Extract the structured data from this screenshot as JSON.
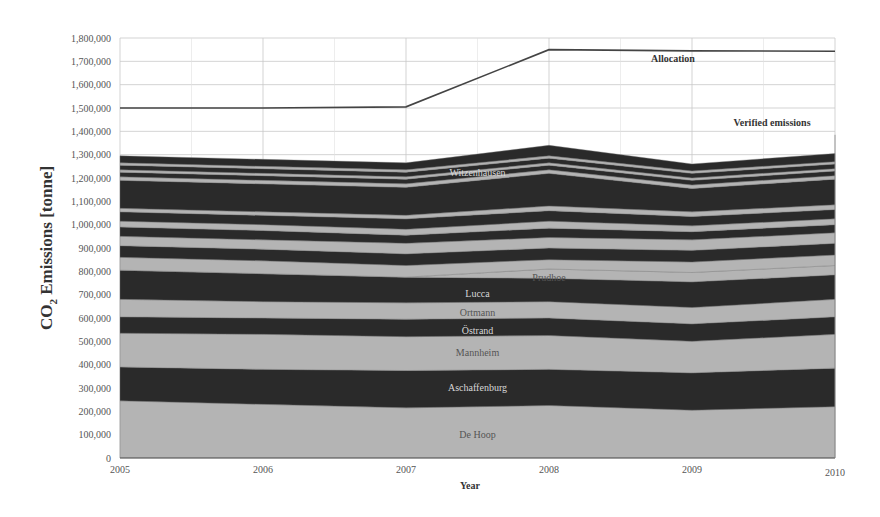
{
  "chart_data": {
    "type": "area",
    "stacked": true,
    "title": "",
    "xlabel": "Year",
    "ylabel": "CO2 Emissions [tonne]",
    "ylabel_main": "CO",
    "ylabel_sub": "2",
    "ylabel_rest": " Emissions [tonne]",
    "x": [
      2005,
      2006,
      2007,
      2008,
      2009,
      2010
    ],
    "x_tick_labels": [
      "2005",
      "2006",
      "2007",
      "2008",
      "2009",
      "2010"
    ],
    "ylim": [
      0,
      1800000
    ],
    "y_ticks": [
      0,
      100000,
      200000,
      300000,
      400000,
      500000,
      600000,
      700000,
      800000,
      900000,
      1000000,
      1100000,
      1200000,
      1300000,
      1400000,
      1500000,
      1600000,
      1700000,
      1800000
    ],
    "y_tick_labels": [
      "0",
      "100,000",
      "200,000",
      "300,000",
      "400,000",
      "500,000",
      "600,000",
      "700,000",
      "800,000",
      "900,000",
      "1,000,000",
      "1,100,000",
      "1,200,000",
      "1,300,000",
      "1,400,000",
      "1,500,000",
      "1,600,000",
      "1,700,000",
      "1,800,000"
    ],
    "grid": true,
    "legend": "none (inline labels)",
    "series": [
      {
        "name": "De Hoop",
        "shade": "light",
        "label_shown": true,
        "values": [
          245000,
          230000,
          215000,
          225000,
          205000,
          220000
        ]
      },
      {
        "name": "Aschaffenburg",
        "shade": "dark",
        "label_shown": true,
        "values": [
          145000,
          150000,
          160000,
          155000,
          160000,
          165000
        ]
      },
      {
        "name": "Mannheim",
        "shade": "light",
        "label_shown": true,
        "values": [
          145000,
          150000,
          145000,
          145000,
          135000,
          145000
        ]
      },
      {
        "name": "Östrand",
        "shade": "dark",
        "label_shown": true,
        "values": [
          70000,
          70000,
          75000,
          75000,
          75000,
          75000
        ]
      },
      {
        "name": "Ortmann",
        "shade": "light",
        "label_shown": true,
        "values": [
          75000,
          70000,
          70000,
          70000,
          70000,
          75000
        ]
      },
      {
        "name": "Lucca",
        "shade": "dark",
        "label_shown": true,
        "values": [
          125000,
          120000,
          110000,
          100000,
          110000,
          105000
        ]
      },
      {
        "name": "Prudhoe",
        "shade": "light",
        "label_shown": true,
        "values": [
          0,
          0,
          0,
          40000,
          40000,
          40000
        ]
      },
      {
        "name": "Plant 8",
        "shade": "light",
        "label_shown": false,
        "values": [
          55000,
          55000,
          50000,
          40000,
          45000,
          45000
        ]
      },
      {
        "name": "Plant 9",
        "shade": "dark",
        "label_shown": false,
        "values": [
          50000,
          50000,
          50000,
          50000,
          50000,
          50000
        ]
      },
      {
        "name": "Plant 10",
        "shade": "light",
        "label_shown": false,
        "values": [
          40000,
          40000,
          45000,
          45000,
          45000,
          45000
        ]
      },
      {
        "name": "Plant 11",
        "shade": "dark",
        "label_shown": false,
        "values": [
          40000,
          40000,
          35000,
          40000,
          35000,
          35000
        ]
      },
      {
        "name": "Plant 12",
        "shade": "light",
        "label_shown": false,
        "values": [
          25000,
          25000,
          25000,
          30000,
          25000,
          25000
        ]
      },
      {
        "name": "Plant 13",
        "shade": "dark",
        "label_shown": false,
        "values": [
          40000,
          40000,
          45000,
          45000,
          40000,
          40000
        ]
      },
      {
        "name": "Plant 14",
        "shade": "light",
        "label_shown": false,
        "values": [
          15000,
          15000,
          15000,
          20000,
          20000,
          20000
        ]
      },
      {
        "name": "Witzenhausen",
        "shade": "dark",
        "label_shown": true,
        "values": [
          120000,
          120000,
          120000,
          140000,
          100000,
          110000
        ]
      },
      {
        "name": "Plant 16",
        "shade": "light",
        "label_shown": false,
        "values": [
          15000,
          15000,
          15000,
          15000,
          15000,
          15000
        ]
      },
      {
        "name": "Plant 17",
        "shade": "dark",
        "label_shown": false,
        "values": [
          20000,
          20000,
          20000,
          20000,
          20000,
          20000
        ]
      },
      {
        "name": "Plant 18",
        "shade": "light",
        "label_shown": false,
        "values": [
          10000,
          10000,
          10000,
          10000,
          10000,
          10000
        ]
      },
      {
        "name": "Plant 19",
        "shade": "dark",
        "label_shown": false,
        "values": [
          20000,
          20000,
          20000,
          20000,
          20000,
          20000
        ]
      },
      {
        "name": "Plant 20",
        "shade": "light",
        "label_shown": false,
        "values": [
          10000,
          10000,
          10000,
          10000,
          10000,
          10000
        ]
      },
      {
        "name": "Plant 21",
        "shade": "dark",
        "label_shown": false,
        "values": [
          30000,
          30000,
          30000,
          45000,
          30000,
          35000
        ]
      }
    ],
    "verified_emissions_total": [
      1335000,
      1320000,
      1305000,
      1510000,
      1350000,
      1385000
    ],
    "allocation": {
      "name": "Allocation",
      "values": [
        1500000,
        1500000,
        1505000,
        1750000,
        1745000,
        1743000
      ]
    },
    "annotations": [
      {
        "text": "Allocation",
        "x": 2008.6,
        "y": 1680000
      },
      {
        "text": "Verified emissions",
        "x": 2009.7,
        "y": 1430000
      },
      {
        "text": "Witzenhausen",
        "x": 2007.5,
        "y": 1220000
      },
      {
        "text": "Prudhoe",
        "x": 2008.0,
        "y": 770000
      },
      {
        "text": "Lucca",
        "x": 2007.5,
        "y": 705000
      },
      {
        "text": "Ortmann",
        "x": 2007.5,
        "y": 620000
      },
      {
        "text": "Östrand",
        "x": 2007.5,
        "y": 545000
      },
      {
        "text": "Mannheim",
        "x": 2007.5,
        "y": 450000
      },
      {
        "text": "Aschaffenburg",
        "x": 2007.5,
        "y": 300000
      },
      {
        "text": "De Hoop",
        "x": 2007.5,
        "y": 100000
      }
    ]
  },
  "colors": {
    "light_band": "#b4b4b4",
    "dark_band": "#2a2a2a",
    "allocation_line": "#444444",
    "grid": "#c8c8c8",
    "label_on_light": "#555555",
    "label_on_dark": "#d8d8d8"
  },
  "labels": {
    "allocation": "Allocation",
    "verified_emissions": "Verified emissions"
  }
}
